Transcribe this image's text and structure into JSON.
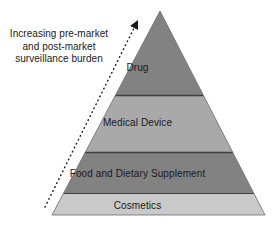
{
  "figure": {
    "background_color": "#ffffff",
    "text_color": "#1a1a1a"
  },
  "annotation": {
    "name": "increasing-burden-annotation",
    "text": "Increasing pre-market and post-market surveillance burden",
    "arrow": {
      "style": "dotted",
      "direction": "up-right",
      "from": [
        45,
        207
      ],
      "to": [
        138,
        22
      ],
      "color": "#1a1a1a"
    }
  },
  "pyramid": {
    "apex": [
      160,
      11
    ],
    "base_left": [
      52,
      215
    ],
    "base_right": [
      265,
      215
    ],
    "outline_color": "#6b6b6b",
    "divider_color": "#3f3f3f",
    "tiers": [
      {
        "label": "Drug",
        "color": "#828282",
        "top_y": 11,
        "bottom_y": 95,
        "rank": 1
      },
      {
        "label": "Medical Device",
        "color": "#a9a9a9",
        "top_y": 95,
        "bottom_y": 152,
        "rank": 2
      },
      {
        "label": "Food and Dietary Supplement",
        "color": "#828282",
        "top_y": 152,
        "bottom_y": 193,
        "rank": 3
      },
      {
        "label": "Cosmetics",
        "color": "#c9c9c9",
        "top_y": 193,
        "bottom_y": 215,
        "rank": 4
      }
    ]
  }
}
